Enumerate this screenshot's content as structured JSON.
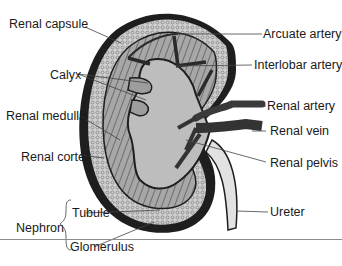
{
  "diagram": {
    "labels": {
      "renal_capsule": "Renal capsule",
      "calyx": "Calyx",
      "renal_medulla": "Renal medulla",
      "renal_cortex": "Renal cortex",
      "nephron": "Nephron",
      "tubule": "Tubule",
      "glomerulus": "Glomerulus",
      "arcuate_artery": "Arcuate artery",
      "interlobar_artery": "Interlobar artery",
      "renal_artery": "Renal artery",
      "renal_vein": "Renal vein",
      "renal_pelvis": "Renal pelvis",
      "ureter": "Ureter"
    },
    "colors": {
      "capsule": "#1e1e1e",
      "cortex": "#c8c8c8",
      "medulla": "#9a9a9a",
      "pelvis": "#bdbdbd",
      "vessels": "#3a3a3a",
      "ureter": "#e2e2e2",
      "leader_line": "#444444"
    }
  }
}
